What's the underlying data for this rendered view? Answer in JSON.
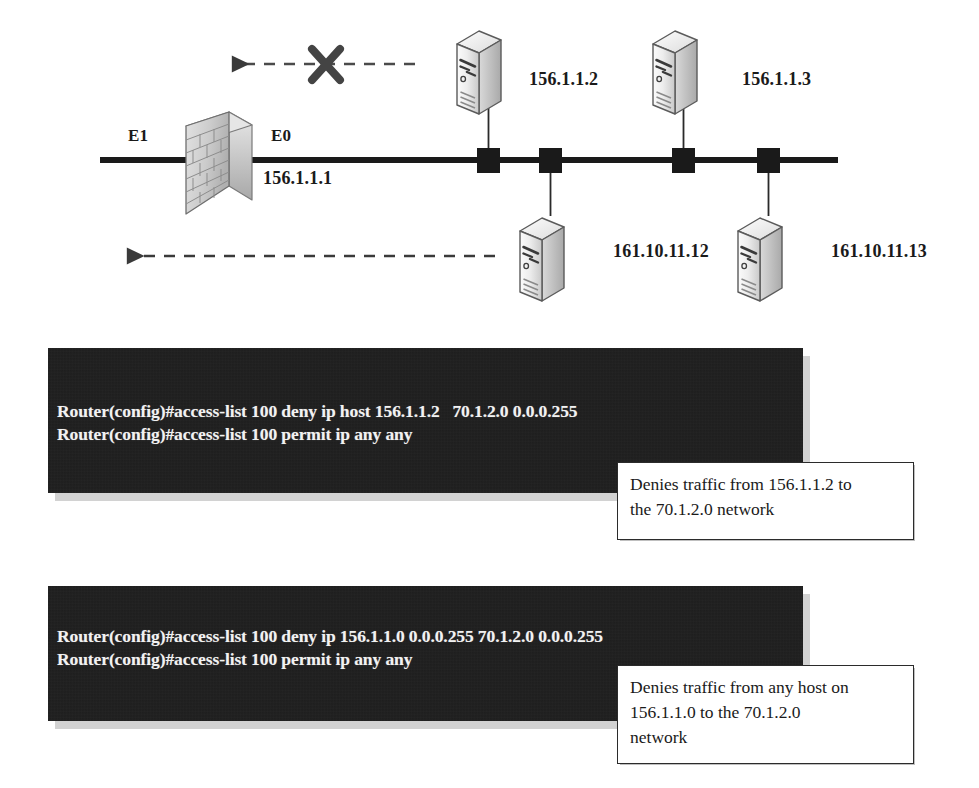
{
  "diagram": {
    "interfaces": [
      {
        "name": "interface-e1",
        "label": "E1"
      },
      {
        "name": "interface-e0",
        "label": "E0"
      }
    ],
    "router_interface_ip": "156.1.1.1",
    "firewall": {
      "icon": "brick-wall-firewall-icon",
      "label": ""
    },
    "top_servers": [
      {
        "icon": "server-icon",
        "label": "156.1.1.2"
      },
      {
        "icon": "server-icon",
        "label": "156.1.1.3"
      }
    ],
    "bottom_servers": [
      {
        "icon": "server-icon",
        "label": "161.10.11.12"
      },
      {
        "icon": "server-icon",
        "label": "161.10.11.13"
      }
    ],
    "flows": [
      {
        "name": "blocked-traffic-arrow",
        "icon": "x-block-icon",
        "direction": "left",
        "blocked": true
      },
      {
        "name": "permitted-traffic-arrow",
        "icon": "dashed-arrow-icon",
        "direction": "left",
        "blocked": false
      }
    ],
    "colors": {
      "line": "#1a1a1a",
      "server_body": "#e8e8e8",
      "server_edge": "#4a4a4a",
      "brick": "#cfcfcf"
    }
  },
  "examples": [
    {
      "id": "example-host-acl",
      "code_lines": [
        "Router(config)#access-list 100 deny ip host 156.1.1.2   70.1.2.0 0.0.0.255",
        "Router(config)#access-list 100 permit ip any any"
      ],
      "callout": "Denies traffic from 156.1.1.2 to\nthe 70.1.2.0 network"
    },
    {
      "id": "example-network-acl",
      "code_lines": [
        "Router(config)#access-list 100 deny ip 156.1.1.0 0.0.0.255 70.1.2.0 0.0.0.255",
        "Router(config)#access-list 100 permit ip any any"
      ],
      "callout": "Denies traffic from any host on\n156.1.1.0 to the 70.1.2.0\nnetwork"
    }
  ]
}
